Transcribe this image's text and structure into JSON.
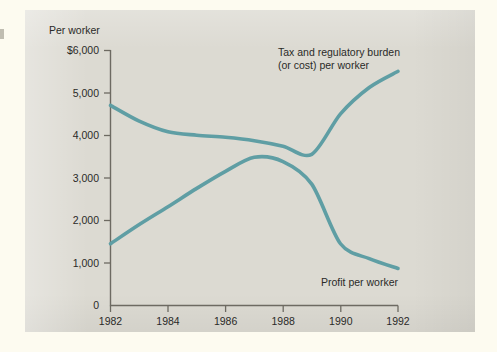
{
  "figure": {
    "panel_background": "#dcdad2",
    "page_background": "#fdfbf0",
    "series_color": "#5f9ea4",
    "axis_color": "#6d6a62",
    "text_color": "#2a2a28"
  },
  "chart_data": {
    "type": "line",
    "title": "",
    "subtitle": "",
    "xlabel": "",
    "ylabel": "Per worker",
    "y_axis_caption": "Per worker",
    "xlim": [
      1982,
      1992
    ],
    "ylim": [
      0,
      6000
    ],
    "grid": false,
    "legend_position": "inline-annotations",
    "x_ticks": [
      1982,
      1984,
      1986,
      1988,
      1990,
      1992
    ],
    "x_tick_labels": [
      "1982",
      "1984",
      "1986",
      "1988",
      "1990",
      "1992"
    ],
    "y_ticks": [
      0,
      1000,
      2000,
      3000,
      4000,
      5000,
      6000
    ],
    "y_tick_labels": [
      "0",
      "1,000",
      "2,000",
      "3,000",
      "4,000",
      "5,000",
      "$6,000"
    ],
    "x": [
      1982,
      1983,
      1984,
      1985,
      1986,
      1987,
      1988,
      1989,
      1990,
      1991,
      1992
    ],
    "series": [
      {
        "name": "Tax and regulatory burden (or cost) per worker",
        "label_line1": "Tax and regulatory burden",
        "label_line2": "(or cost) per worker",
        "color": "#5f9ea4",
        "values": [
          4700,
          4330,
          4080,
          4000,
          3950,
          3870,
          3740,
          3550,
          4500,
          5120,
          5500
        ]
      },
      {
        "name": "Profit per worker",
        "label_line1": "Profit per worker",
        "label_line2": "",
        "color": "#5f9ea4",
        "values": [
          1450,
          1900,
          2320,
          2750,
          3150,
          3480,
          3380,
          2850,
          1450,
          1100,
          870
        ]
      }
    ],
    "annotations": [
      {
        "id": "tax-burden-label",
        "line1": "Tax and regulatory burden",
        "line2": "(or cost) per worker",
        "x": 1988.1,
        "y": 5760
      },
      {
        "id": "profit-label",
        "line1": "Profit per worker",
        "line2": "",
        "x": 1991.2,
        "y": 700
      }
    ]
  }
}
